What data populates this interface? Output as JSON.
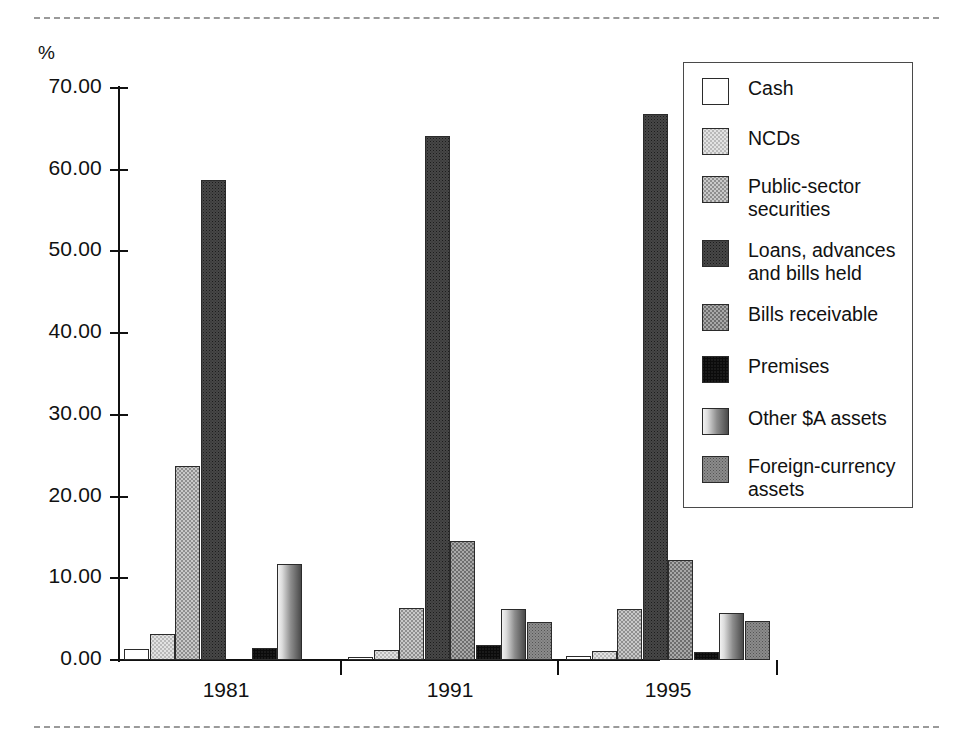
{
  "axis": {
    "y_unit_label": "%",
    "y_ticks": [
      "0.00",
      "10.00",
      "20.00",
      "30.00",
      "40.00",
      "50.00",
      "60.00",
      "70.00"
    ],
    "x_ticks": [
      "1981",
      "1991",
      "1995"
    ]
  },
  "legend": {
    "items": [
      {
        "label": "Cash",
        "pattern": "p-cash",
        "key": "cash"
      },
      {
        "label": "NCDs",
        "pattern": "p-ncds",
        "key": "ncds"
      },
      {
        "label": "Public-sector\nsecurities",
        "pattern": "p-pubsec",
        "key": "public-sector-securities"
      },
      {
        "label": "Loans, advances\nand bills held",
        "pattern": "p-loans",
        "key": "loans-advances-and-bills-held"
      },
      {
        "label": "Bills receivable",
        "pattern": "p-bills",
        "key": "bills-receivable"
      },
      {
        "label": "Premises",
        "pattern": "p-premises",
        "key": "premises"
      },
      {
        "label": "Other $A assets",
        "pattern": "p-othera",
        "key": "other-a-assets"
      },
      {
        "label": "Foreign-currency\nassets",
        "pattern": "p-fx",
        "key": "foreign-currency-assets"
      }
    ]
  },
  "chart_data": {
    "type": "bar",
    "title": "",
    "xlabel": "",
    "ylabel": "%",
    "ylim": [
      0,
      70
    ],
    "ytick_step": 10,
    "grid": false,
    "legend_position": "top-right",
    "categories": [
      "1981",
      "1991",
      "1995"
    ],
    "series": [
      {
        "name": "Cash",
        "values": [
          1.3,
          0.4,
          0.5
        ]
      },
      {
        "name": "NCDs",
        "values": [
          3.2,
          1.2,
          1.1
        ]
      },
      {
        "name": "Public-sector securities",
        "values": [
          23.7,
          6.4,
          6.3
        ]
      },
      {
        "name": "Loans, advances and bills held",
        "values": [
          58.7,
          64.1,
          66.8
        ]
      },
      {
        "name": "Bills receivable",
        "values": [
          0.0,
          14.6,
          12.2
        ]
      },
      {
        "name": "Premises",
        "values": [
          1.5,
          1.8,
          1.0
        ]
      },
      {
        "name": "Other $A assets",
        "values": [
          11.8,
          6.3,
          5.7
        ]
      },
      {
        "name": "Foreign-currency assets",
        "values": [
          0.0,
          4.6,
          4.8
        ]
      }
    ]
  }
}
